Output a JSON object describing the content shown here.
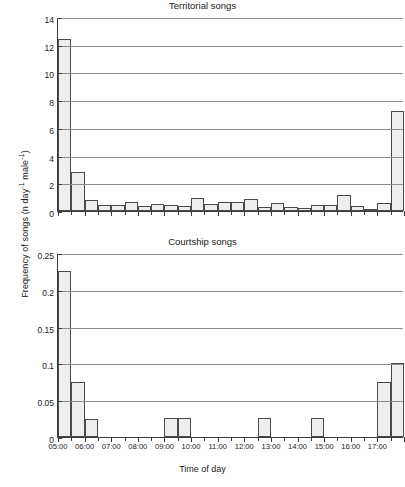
{
  "figure": {
    "ylabel": "Frequency of songs (n day",
    "ylabel_sup1": "-1",
    "ylabel_mid": " male",
    "ylabel_sup2": "-1",
    "ylabel_end": ")",
    "xlabel": "Time of day"
  },
  "chart_data": [
    {
      "type": "bar",
      "title": "Territorial songs",
      "xlabel": "Time of day",
      "ylabel": "Frequency of songs (n day-1 male-1)",
      "ylim": [
        0,
        14
      ],
      "yticks": [
        0,
        2,
        4,
        6,
        8,
        10,
        12,
        14
      ],
      "ytick_labels": [
        "0",
        "2",
        "4",
        "6",
        "8",
        "10",
        "12",
        "14"
      ],
      "grid": true,
      "legend": "none",
      "xlim": [
        "05:00",
        "17:30"
      ],
      "xtick_labels": [
        "05:00",
        "06:00",
        "07:00",
        "08:00",
        "09:00",
        "10:00",
        "11:00",
        "12:00",
        "13:00",
        "14:00",
        "15:00",
        "16:00",
        "17:00"
      ],
      "bin_width_minutes": 30,
      "categories": [
        "05:00",
        "05:30",
        "06:00",
        "06:30",
        "07:00",
        "07:30",
        "08:00",
        "08:30",
        "09:00",
        "09:30",
        "10:00",
        "10:30",
        "11:00",
        "11:30",
        "12:00",
        "12:30",
        "13:00",
        "13:30",
        "14:00",
        "14:30",
        "15:00",
        "15:30",
        "16:00",
        "16:30",
        "17:00",
        "17:30"
      ],
      "values": [
        12.4,
        2.85,
        0.78,
        0.42,
        0.42,
        0.65,
        0.35,
        0.5,
        0.45,
        0.33,
        0.92,
        0.48,
        0.68,
        0.68,
        0.85,
        0.3,
        0.6,
        0.3,
        0.2,
        0.4,
        0.4,
        1.15,
        0.35,
        0.18,
        0.55,
        7.25
      ]
    },
    {
      "type": "bar",
      "title": "Courtship songs",
      "xlabel": "Time of day",
      "ylabel": "Frequency of songs (n day-1 male-1)",
      "ylim": [
        0,
        0.25
      ],
      "yticks": [
        0,
        0.05,
        0.1,
        0.15,
        0.2,
        0.25
      ],
      "ytick_labels": [
        "0",
        "0.05",
        "0.1",
        "0.15",
        "0.2",
        "0.25"
      ],
      "grid": true,
      "legend": "none",
      "xlim": [
        "05:00",
        "17:30"
      ],
      "xtick_labels": [
        "05:00",
        "06:00",
        "07:00",
        "08:00",
        "09:00",
        "10:00",
        "11:00",
        "12:00",
        "13:00",
        "14:00",
        "15:00",
        "16:00",
        "17:00"
      ],
      "bin_width_minutes": 30,
      "categories": [
        "05:00",
        "05:30",
        "06:00",
        "06:30",
        "07:00",
        "07:30",
        "08:00",
        "08:30",
        "09:00",
        "09:30",
        "10:00",
        "10:30",
        "11:00",
        "11:30",
        "12:00",
        "12:30",
        "13:00",
        "13:30",
        "14:00",
        "14:30",
        "15:00",
        "15:30",
        "16:00",
        "16:30",
        "17:00",
        "17:30"
      ],
      "values": [
        0.225,
        0.075,
        0.025,
        0,
        0,
        0,
        0,
        0,
        0.026,
        0.026,
        0,
        0,
        0,
        0,
        0,
        0.026,
        0,
        0,
        0,
        0.026,
        0,
        0,
        0,
        0,
        0.075,
        0.101
      ]
    }
  ]
}
